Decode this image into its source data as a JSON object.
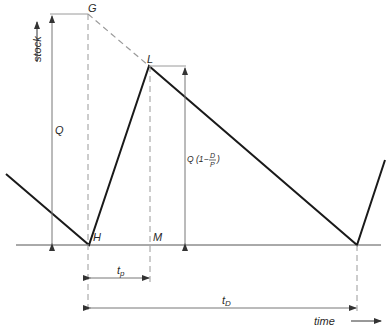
{
  "diagram": {
    "type": "inventory-production-sawtooth",
    "axes": {
      "y_label": "stock",
      "x_label": "time"
    },
    "points": {
      "G": "G",
      "L": "L",
      "H": "H",
      "M": "M"
    },
    "dimensions": {
      "Q": "Q",
      "Q_net": "Q (1−",
      "frac_num": "D",
      "frac_den": "P",
      "frac_close": ")",
      "t_p": "t",
      "t_p_sub": "p",
      "t_D": "t",
      "t_D_sub": "D"
    },
    "colors": {
      "stock_line": "#1a1a1a",
      "guide_line": "#9a9a9a",
      "axis": "#555555"
    }
  }
}
